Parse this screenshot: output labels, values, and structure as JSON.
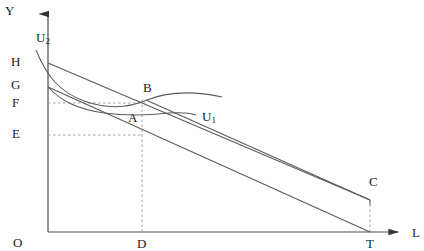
{
  "figure": {
    "axes": {
      "y_axis_label": "Y",
      "x_axis_label": "L",
      "origin_label": "O",
      "y_axis_x": 48,
      "x_axis_y": 232,
      "y_axis_top": 8,
      "x_axis_right": 404
    },
    "colors": {
      "line": "#555555",
      "axis": "#444444",
      "dashed": "#999999",
      "text": "#1a1a1a",
      "background": "#ffffff"
    }
  },
  "labels": [
    {
      "id": "y-axis-label",
      "text": "Y",
      "sub": "",
      "x": 5,
      "y": 4
    },
    {
      "id": "x-axis-label",
      "text": "L",
      "sub": "",
      "x": 412,
      "y": 226
    },
    {
      "id": "origin-label",
      "text": "O",
      "sub": "",
      "x": 13,
      "y": 236
    },
    {
      "id": "y-tick-label-h",
      "text": "H",
      "sub": "",
      "x": 11,
      "y": 55
    },
    {
      "id": "y-tick-label-g",
      "text": "G",
      "sub": "",
      "x": 11,
      "y": 78
    },
    {
      "id": "y-tick-label-f",
      "text": "F",
      "sub": "",
      "x": 12,
      "y": 96
    },
    {
      "id": "y-tick-label-e",
      "text": "E",
      "sub": "",
      "x": 12,
      "y": 127
    },
    {
      "id": "x-tick-label-d",
      "text": "D",
      "sub": "",
      "x": 137,
      "y": 237
    },
    {
      "id": "x-tick-label-t",
      "text": "T",
      "sub": "",
      "x": 366,
      "y": 237
    },
    {
      "id": "point-label-a",
      "text": "A",
      "sub": "",
      "x": 128,
      "y": 111
    },
    {
      "id": "point-label-b",
      "text": "B",
      "sub": "",
      "x": 143,
      "y": 81
    },
    {
      "id": "point-label-c",
      "text": "C",
      "sub": "",
      "x": 369,
      "y": 175
    },
    {
      "id": "curve-label-u2",
      "text": "U",
      "sub": "2",
      "x": 36,
      "y": 31
    },
    {
      "id": "curve-label-u1",
      "text": "U",
      "sub": "1",
      "x": 202,
      "y": 110
    }
  ],
  "chart_data": {
    "type": "line",
    "xlabel": "L",
    "ylabel": "Y",
    "xlim": [
      48,
      404
    ],
    "ylim": [
      232,
      8
    ],
    "grid": false,
    "legend": "inline-curve-labels",
    "y_tick_values": [
      {
        "name": "H",
        "pixel_y": 63
      },
      {
        "name": "G",
        "pixel_y": 87
      },
      {
        "name": "F",
        "pixel_y": 103
      },
      {
        "name": "E",
        "pixel_y": 135
      }
    ],
    "x_tick_values": [
      {
        "name": "O",
        "pixel_x": 48
      },
      {
        "name": "D",
        "pixel_x": 142
      },
      {
        "name": "T",
        "pixel_x": 370
      }
    ],
    "points": [
      {
        "name": "A",
        "x": 142,
        "y": 113,
        "on_curve": "U1"
      },
      {
        "name": "B",
        "x": 146,
        "y": 100,
        "on_curve": "U2"
      },
      {
        "name": "C",
        "x": 370,
        "y": 200,
        "on_curve": "budget-line-upper"
      }
    ],
    "series": [
      {
        "name": "U2",
        "kind": "indifference-curve",
        "path": "M 36,50 C 48,78 60,92 84,101 C 115,112 135,106 150,100 C 175,91 200,93 222,97"
      },
      {
        "name": "U1",
        "kind": "indifference-curve",
        "path": "M 48,87 C 60,101 76,109 104,113 C 128,116 150,115 168,113 C 182,112 190,113 196,115"
      },
      {
        "name": "budget-line-upper",
        "kind": "budget-line",
        "from": "H",
        "to": "C",
        "path": "M 48,63 L 370,200"
      },
      {
        "name": "budget-line-lower",
        "kind": "budget-line",
        "from": "G",
        "to": "T",
        "path": "M 48,87 L 370,232"
      },
      {
        "name": "kink-segment",
        "kind": "budget-line-kink",
        "path": "M 146,100 L 370,200"
      }
    ],
    "dashed_guides": [
      {
        "name": "f-horizontal",
        "from": [
          48,
          103
        ],
        "to": [
          146,
          103
        ]
      },
      {
        "name": "e-horizontal",
        "from": [
          48,
          135
        ],
        "to": [
          142,
          135
        ]
      },
      {
        "name": "d-vertical",
        "from": [
          142,
          232
        ],
        "to": [
          142,
          100
        ]
      },
      {
        "name": "t-vertical",
        "from": [
          370,
          232
        ],
        "to": [
          370,
          200
        ]
      }
    ]
  }
}
